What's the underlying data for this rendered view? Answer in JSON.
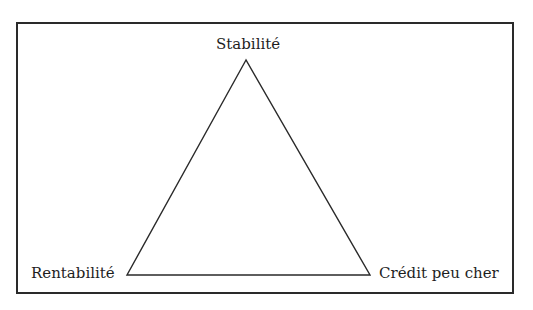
{
  "diagram": {
    "type": "triangle",
    "vertices": {
      "top": "Stabilité",
      "bottom_left": "Rentabilité",
      "bottom_right": "Crédit peu cher"
    },
    "colors": {
      "stroke": "#2a2a2a",
      "text": "#1e1e1e",
      "background": "#ffffff"
    }
  }
}
